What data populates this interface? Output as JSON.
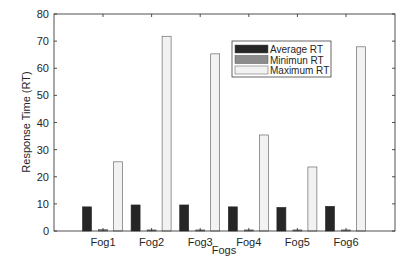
{
  "chart_data": {
    "type": "bar",
    "title": "",
    "xlabel": "Fogs",
    "ylabel": "Response Time (RT)",
    "ylim": [
      0,
      80
    ],
    "yticks": [
      0,
      10,
      20,
      30,
      40,
      50,
      60,
      70,
      80
    ],
    "grid": false,
    "legend_position": "upper center (inside)",
    "categories": [
      "Fog1",
      "Fog2",
      "Fog3",
      "Fog4",
      "Fog5",
      "Fog6"
    ],
    "series": [
      {
        "name": "Average RT",
        "color": "#262626",
        "values": [
          8.9,
          9.6,
          9.6,
          8.9,
          8.7,
          9.1
        ]
      },
      {
        "name": "Minimun RT",
        "color": "#8c8c8c",
        "values": [
          0.5,
          0.4,
          0.4,
          0.4,
          0.4,
          0.4
        ]
      },
      {
        "name": "Maximum RT",
        "color": "#f2f2f2",
        "values": [
          25.5,
          71.8,
          65.3,
          35.4,
          23.6,
          67.9
        ]
      }
    ]
  }
}
